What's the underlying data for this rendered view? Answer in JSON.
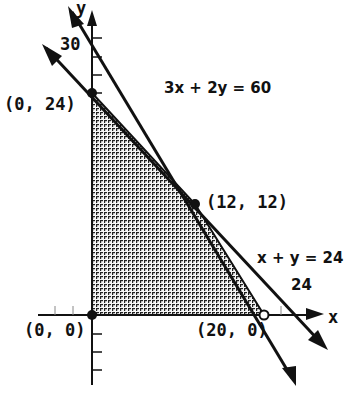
{
  "diagram": {
    "type": "linear-programming-feasible-region",
    "axes": {
      "x_label": "x",
      "y_label": "y",
      "y_tick_label": "30",
      "x_tick_label": "24"
    },
    "lines": [
      {
        "equation": "3x + 2y = 60",
        "x_intercept": 20,
        "y_intercept": 30
      },
      {
        "equation": "x + y = 24",
        "x_intercept": 24,
        "y_intercept": 24
      }
    ],
    "vertices": [
      {
        "label": "(0, 24)",
        "x": 0,
        "y": 24
      },
      {
        "label": "(12, 12)",
        "x": 12,
        "y": 12
      },
      {
        "label": "(20, 0)",
        "x": 20,
        "y": 0
      },
      {
        "label": "(0, 0)",
        "x": 0,
        "y": 0
      }
    ],
    "shaded_region": "feasible region bounded by (0,0), (0,24), (12,12), (20,0)",
    "colors": {
      "ink": "#111111",
      "shade": "#555555",
      "background": "#ffffff"
    }
  }
}
